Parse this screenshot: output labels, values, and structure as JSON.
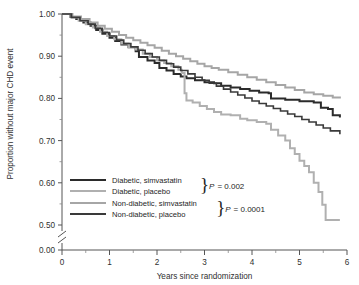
{
  "chart_data": {
    "type": "line",
    "title": "",
    "xlabel": "Years since randomization",
    "ylabel": "Proportion without major CHD event",
    "xlim": [
      0,
      6
    ],
    "ylim": [
      0.5,
      1.0
    ],
    "y_axis_break": true,
    "y_break_labels": [
      "0.50",
      "0.00"
    ],
    "grid": false,
    "legend_position": "lower-left-inside",
    "xticks": [
      0,
      1,
      2,
      3,
      4,
      5,
      6
    ],
    "xticklabels": [
      "0",
      "1",
      "2",
      "3",
      "4",
      "5",
      "6"
    ],
    "xminor_step": 0.5,
    "yticks": [
      1.0,
      0.9,
      0.8,
      0.7,
      0.6,
      0.5,
      0.0
    ],
    "yticklabels": [
      "1.00",
      "0.90",
      "0.80",
      "0.70",
      "0.60",
      "0.50",
      "0.00"
    ],
    "yminor_step": 0.05,
    "series": [
      {
        "name": "Diabetic, simvastatin",
        "color": "#2b2b2b",
        "width": 2.0,
        "points": [
          [
            0.0,
            1.0
          ],
          [
            0.18,
            0.993
          ],
          [
            0.3,
            0.988
          ],
          [
            0.45,
            0.98
          ],
          [
            0.6,
            0.972
          ],
          [
            0.72,
            0.962
          ],
          [
            0.85,
            0.953
          ],
          [
            1.0,
            0.944
          ],
          [
            1.12,
            0.936
          ],
          [
            1.25,
            0.928
          ],
          [
            1.4,
            0.921
          ],
          [
            1.55,
            0.912
          ],
          [
            1.62,
            0.898
          ],
          [
            1.8,
            0.89
          ],
          [
            1.95,
            0.884
          ],
          [
            2.05,
            0.872
          ],
          [
            2.2,
            0.866
          ],
          [
            2.35,
            0.858
          ],
          [
            2.5,
            0.852
          ],
          [
            2.62,
            0.848
          ],
          [
            2.8,
            0.843
          ],
          [
            3.0,
            0.838
          ],
          [
            3.2,
            0.836
          ],
          [
            3.35,
            0.83
          ],
          [
            3.55,
            0.826
          ],
          [
            3.75,
            0.822
          ],
          [
            3.95,
            0.818
          ],
          [
            4.15,
            0.814
          ],
          [
            4.35,
            0.812
          ],
          [
            4.4,
            0.8
          ],
          [
            4.7,
            0.797
          ],
          [
            5.0,
            0.793
          ],
          [
            5.3,
            0.79
          ],
          [
            5.45,
            0.778
          ],
          [
            5.6,
            0.775
          ],
          [
            5.7,
            0.76
          ],
          [
            5.85,
            0.755
          ]
        ]
      },
      {
        "name": "Diabetic, placebo",
        "color": "#b0b0b0",
        "width": 2.0,
        "points": [
          [
            0.0,
            1.0
          ],
          [
            0.2,
            0.992
          ],
          [
            0.35,
            0.984
          ],
          [
            0.5,
            0.976
          ],
          [
            0.65,
            0.968
          ],
          [
            0.8,
            0.958
          ],
          [
            0.95,
            0.948
          ],
          [
            1.1,
            0.94
          ],
          [
            1.25,
            0.93
          ],
          [
            1.4,
            0.922
          ],
          [
            1.55,
            0.916
          ],
          [
            1.7,
            0.906
          ],
          [
            1.85,
            0.898
          ],
          [
            2.0,
            0.89
          ],
          [
            2.15,
            0.884
          ],
          [
            2.3,
            0.876
          ],
          [
            2.45,
            0.868
          ],
          [
            2.52,
            0.86
          ],
          [
            2.58,
            0.812
          ],
          [
            2.62,
            0.795
          ],
          [
            2.75,
            0.79
          ],
          [
            2.9,
            0.782
          ],
          [
            3.05,
            0.775
          ],
          [
            3.2,
            0.768
          ],
          [
            3.35,
            0.762
          ],
          [
            3.55,
            0.76
          ],
          [
            3.75,
            0.752
          ],
          [
            3.9,
            0.748
          ],
          [
            4.1,
            0.744
          ],
          [
            4.3,
            0.74
          ],
          [
            4.4,
            0.726
          ],
          [
            4.55,
            0.712
          ],
          [
            4.7,
            0.7
          ],
          [
            4.8,
            0.682
          ],
          [
            4.9,
            0.668
          ],
          [
            5.0,
            0.652
          ],
          [
            5.1,
            0.64
          ],
          [
            5.2,
            0.625
          ],
          [
            5.3,
            0.6
          ],
          [
            5.4,
            0.578
          ],
          [
            5.48,
            0.548
          ],
          [
            5.55,
            0.512
          ],
          [
            5.85,
            0.512
          ]
        ]
      },
      {
        "name": "Non-diabetic, simvastatin",
        "color": "#a6a6a6",
        "width": 2.0,
        "points": [
          [
            0.0,
            1.0
          ],
          [
            0.22,
            0.994
          ],
          [
            0.4,
            0.988
          ],
          [
            0.58,
            0.98
          ],
          [
            0.75,
            0.972
          ],
          [
            0.9,
            0.965
          ],
          [
            1.05,
            0.958
          ],
          [
            1.2,
            0.95
          ],
          [
            1.35,
            0.944
          ],
          [
            1.5,
            0.938
          ],
          [
            1.65,
            0.932
          ],
          [
            1.8,
            0.926
          ],
          [
            1.95,
            0.92
          ],
          [
            2.1,
            0.913
          ],
          [
            2.25,
            0.906
          ],
          [
            2.4,
            0.9
          ],
          [
            2.55,
            0.894
          ],
          [
            2.7,
            0.888
          ],
          [
            2.85,
            0.882
          ],
          [
            3.0,
            0.876
          ],
          [
            3.15,
            0.872
          ],
          [
            3.3,
            0.868
          ],
          [
            3.5,
            0.862
          ],
          [
            3.7,
            0.856
          ],
          [
            3.9,
            0.85
          ],
          [
            4.1,
            0.844
          ],
          [
            4.3,
            0.838
          ],
          [
            4.5,
            0.832
          ],
          [
            4.7,
            0.826
          ],
          [
            4.9,
            0.82
          ],
          [
            5.1,
            0.814
          ],
          [
            5.3,
            0.81
          ],
          [
            5.5,
            0.806
          ],
          [
            5.7,
            0.802
          ],
          [
            5.85,
            0.8
          ]
        ]
      },
      {
        "name": "Non-diabetic, placebo",
        "color": "#3a3a3a",
        "width": 1.6,
        "points": [
          [
            0.0,
            1.0
          ],
          [
            0.2,
            0.992
          ],
          [
            0.38,
            0.984
          ],
          [
            0.55,
            0.976
          ],
          [
            0.7,
            0.966
          ],
          [
            0.85,
            0.956
          ],
          [
            1.0,
            0.948
          ],
          [
            1.15,
            0.938
          ],
          [
            1.3,
            0.93
          ],
          [
            1.45,
            0.922
          ],
          [
            1.6,
            0.914
          ],
          [
            1.75,
            0.906
          ],
          [
            1.9,
            0.898
          ],
          [
            2.05,
            0.89
          ],
          [
            2.2,
            0.882
          ],
          [
            2.35,
            0.874
          ],
          [
            2.5,
            0.866
          ],
          [
            2.65,
            0.858
          ],
          [
            2.8,
            0.85
          ],
          [
            2.95,
            0.843
          ],
          [
            3.1,
            0.836
          ],
          [
            3.25,
            0.829
          ],
          [
            3.4,
            0.822
          ],
          [
            3.55,
            0.815
          ],
          [
            3.7,
            0.808
          ],
          [
            3.85,
            0.801
          ],
          [
            4.0,
            0.794
          ],
          [
            4.15,
            0.788
          ],
          [
            4.3,
            0.782
          ],
          [
            4.45,
            0.776
          ],
          [
            4.6,
            0.77
          ],
          [
            4.75,
            0.763
          ],
          [
            4.9,
            0.757
          ],
          [
            5.05,
            0.75
          ],
          [
            5.2,
            0.744
          ],
          [
            5.35,
            0.737
          ],
          [
            5.5,
            0.73
          ],
          [
            5.65,
            0.723
          ],
          [
            5.85,
            0.715
          ]
        ]
      }
    ],
    "legend_groups": [
      {
        "entries": [
          {
            "label": "Diabetic, simvastatin",
            "color": "#2b2b2b",
            "width": 2.2
          },
          {
            "label": "Diabetic, placebo",
            "color": "#b0b0b0",
            "width": 2.2
          }
        ],
        "p_prefix": "P",
        "p_value": "= 0.002"
      },
      {
        "entries": [
          {
            "label": "Non-diabetic, simvastatin",
            "color": "#a6a6a6",
            "width": 2.2
          },
          {
            "label": "Non-diabetic, placebo",
            "color": "#3a3a3a",
            "width": 2.2
          }
        ],
        "p_prefix": "P",
        "p_value": "= 0.0001"
      }
    ]
  }
}
